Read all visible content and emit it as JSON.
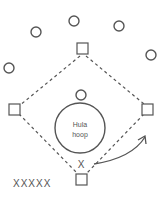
{
  "diagram": {
    "hoop": {
      "line1": "Hula",
      "line2": "hoop"
    },
    "player_marker": "X",
    "queue": "XXXXX",
    "colors": {
      "stroke": "#555555",
      "background": "#ffffff"
    }
  }
}
